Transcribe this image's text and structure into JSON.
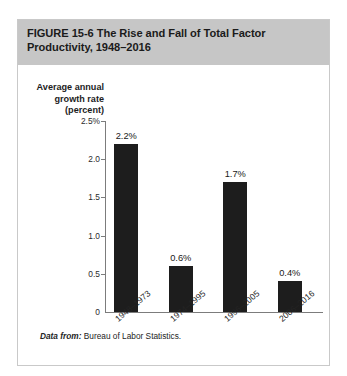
{
  "figure": {
    "title": "FIGURE  15-6   The Rise and Fall of Total Factor\nProductivity, 1948–2016",
    "header_bg": "#c6c6c6",
    "card_border": "#c9c9c9"
  },
  "axis": {
    "y_caption": "Average annual\ngrowth rate\n(percent)",
    "y_ticks": [
      "2.5%",
      "2.0",
      "1.5",
      "1.0",
      "0.5",
      "0"
    ],
    "axis_color": "#7c7c7c"
  },
  "source": {
    "lead": "Data from:",
    "text": " Bureau of Labor Statistics."
  },
  "chart_data": {
    "type": "bar",
    "title": "The Rise and Fall of Total Factor Productivity, 1948–2016",
    "subtitle": "FIGURE 15-6",
    "categories": [
      "1948–1973",
      "1974–1995",
      "1996–2005",
      "2006–2016"
    ],
    "values": [
      2.2,
      0.6,
      1.7,
      0.4
    ],
    "value_labels": [
      "2.2%",
      "0.6%",
      "1.7%",
      "0.4%"
    ],
    "xlabel": "",
    "ylabel": "Average annual growth rate (percent)",
    "ylim": [
      0,
      2.5
    ],
    "ytick_values": [
      2.5,
      2.0,
      1.5,
      1.0,
      0.5,
      0
    ],
    "ytick_labels": [
      "2.5%",
      "2.0",
      "1.5",
      "1.0",
      "0.5",
      "0"
    ],
    "grid": false,
    "legend": false,
    "bar_color": "#1d1d1d",
    "source": "Data from: Bureau of Labor Statistics."
  }
}
